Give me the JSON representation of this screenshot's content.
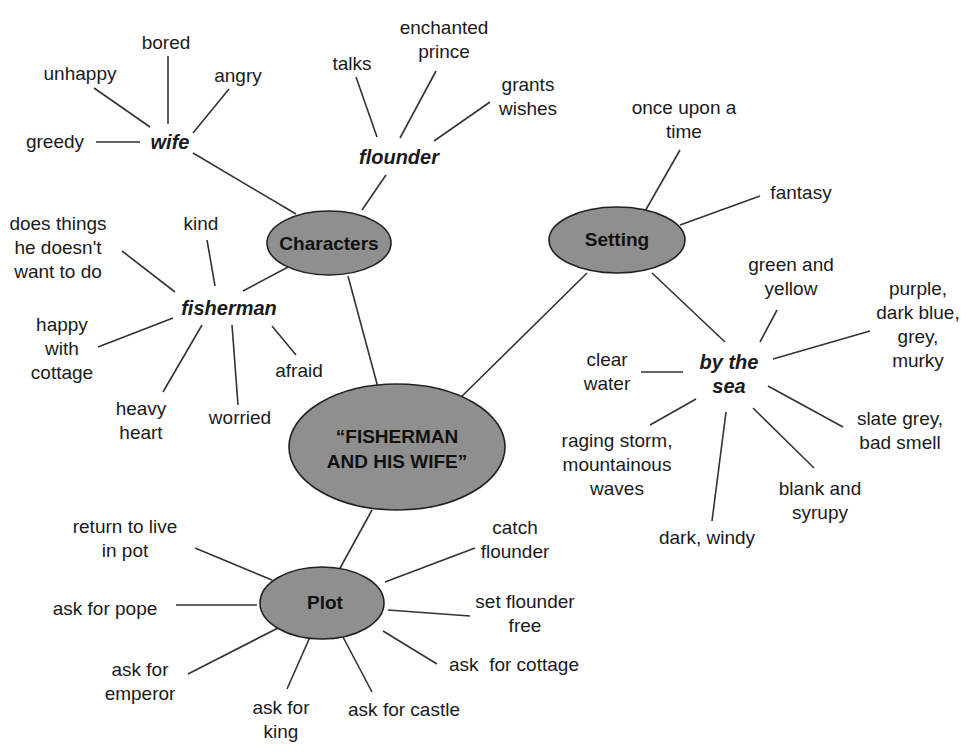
{
  "diagram": {
    "type": "concept-map",
    "center": {
      "label": "“FISHERMAN\nAND HIS WIFE”"
    },
    "nodes": {
      "characters": {
        "label": "Characters"
      },
      "setting": {
        "label": "Setting"
      },
      "plot": {
        "label": "Plot"
      }
    },
    "subtopics": {
      "wife": {
        "label": "wife",
        "details": [
          "bored",
          "unhappy",
          "angry",
          "greedy"
        ]
      },
      "flounder": {
        "label": "flounder",
        "details": [
          "talks",
          "enchanted\nprince",
          "grants\nwishes"
        ]
      },
      "fisherman": {
        "label": "fisherman",
        "details": [
          "does things\nhe doesn't\nwant to do",
          "kind",
          "happy\nwith\ncottage",
          "afraid",
          "heavy\nheart",
          "worried"
        ]
      },
      "by_the_sea": {
        "label": "by the\nsea",
        "details": [
          "green and\nyellow",
          "purple,\ndark blue,\ngrey,\nmurky",
          "clear\nwater",
          "slate grey,\nbad smell",
          "raging storm,\nmountainous\nwaves",
          "blank and\nsyrupy",
          "dark, windy"
        ]
      }
    },
    "setting_details": [
      "once upon a\ntime",
      "fantasy"
    ],
    "plot_details": [
      "return to live\nin pot",
      "catch\nflounder",
      "ask for pope",
      "set flounder\nfree",
      "ask for\nemperor",
      "ask  for cottage",
      "ask for\nking",
      "ask for castle"
    ],
    "colors": {
      "ellipse_fill": "#8f8f8f",
      "ellipse_stroke": "#222222",
      "line": "#333333",
      "text": "#1a1a1a"
    }
  }
}
